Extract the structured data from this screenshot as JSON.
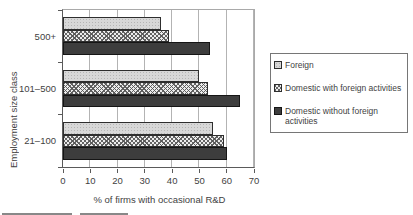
{
  "chart_data": {
    "type": "bar",
    "orientation": "horizontal",
    "title": "",
    "xlabel": "% of firms with occasional R&D",
    "ylabel": "Employment size class",
    "xlim": [
      0,
      70
    ],
    "xticks": [
      0,
      10,
      20,
      30,
      40,
      50,
      60,
      70
    ],
    "grid": "vertical",
    "legend_position": "right",
    "categories": [
      "500+",
      "101–500",
      "21–100"
    ],
    "series": [
      {
        "name": "Foreign",
        "pattern": "light-dotted",
        "color": "#d8d8d8",
        "values": [
          36,
          50,
          55
        ]
      },
      {
        "name": "Domestic with foreign activities",
        "pattern": "crosshatch",
        "color": "#9a9a9a",
        "values": [
          39,
          53,
          59
        ]
      },
      {
        "name": "Domestic without foreign activities",
        "pattern": "dark-solid",
        "color": "#3d3d3d",
        "values": [
          54,
          65,
          60
        ]
      }
    ]
  },
  "legend": {
    "items": [
      {
        "label": "Foreign",
        "pattern": "light-dotted"
      },
      {
        "label": "Domestic with foreign activities",
        "pattern": "crosshatch"
      },
      {
        "label": "Domestic without foreign\nactivities",
        "pattern": "dark-solid"
      }
    ]
  },
  "colors": {
    "background": "#ffffff",
    "gridline": "#b3b3b3",
    "axis": "#5a5a5a",
    "text": "#3f3f3f",
    "legend_border": "#767676"
  }
}
